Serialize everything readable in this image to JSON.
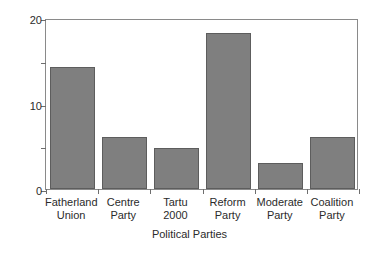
{
  "chart_data": {
    "type": "bar",
    "title": "",
    "xlabel": "Political Parties",
    "ylabel": "Per cent",
    "categories": [
      "Fatherland Union",
      "Centre Party",
      "Tartu 2000",
      "Reform Party",
      "Moderate Party",
      "Coalition Party"
    ],
    "category_lines": [
      [
        "Fatherland",
        "Union"
      ],
      [
        "Centre",
        "Party"
      ],
      [
        "Tartu",
        "2000"
      ],
      [
        "Reform",
        "Party"
      ],
      [
        "Moderate",
        "Party"
      ],
      [
        "Coalition",
        "Party"
      ]
    ],
    "values": [
      14.3,
      6.1,
      4.8,
      18.2,
      3.0,
      6.1
    ],
    "ylim": [
      0,
      20
    ],
    "xlim_note": "categorical",
    "yticks": [
      0,
      5,
      10,
      15,
      20
    ],
    "ytick_labels": [
      "0",
      "",
      "10",
      "",
      "20"
    ],
    "grid": false,
    "legend": "none",
    "bar_color": "#7f7f7f",
    "bar_edge_color": "#5d5d5d",
    "axis_color": "#8a8a8a",
    "text_color": "#2b2b2b",
    "background": "#ffffff"
  }
}
